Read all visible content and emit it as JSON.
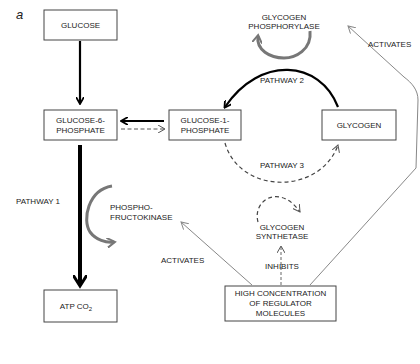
{
  "figure": {
    "panel_label": "a",
    "colors": {
      "strong_arrow": "#000000",
      "enzyme_arrow": "#777777",
      "regulation_line": "#888888",
      "dashed": "#444444"
    }
  },
  "nodes": {
    "glucose": "GLUCOSE",
    "g6p": [
      "GLUCOSE-6-",
      "PHOSPHATE"
    ],
    "g1p": [
      "GLUCOSE-1-",
      "PHOSPHATE"
    ],
    "glycogen": "GLYCOGEN",
    "atp": "ATP CO",
    "atp_sub": "2",
    "regulator": [
      "HIGH CONCENTRATION",
      "OF REGULATOR",
      "MOLECULES"
    ]
  },
  "enzymes": {
    "phosphorylase": [
      "GLYCOGEN",
      "PHOSPHORYLASE"
    ],
    "pfk": [
      "PHOSPHO-",
      "FRUCTOKINASE"
    ],
    "synthetase": [
      "GLYCOGEN",
      "SYNTHETASE"
    ]
  },
  "pathways": {
    "p1": "PATHWAY 1",
    "p2": "PATHWAY 2",
    "p3": "PATHWAY 3"
  },
  "regulation": {
    "activates_pfk": "ACTIVATES",
    "activates_phosphorylase": "ACTIVATES",
    "inhibits_synthetase": "INHIBITS"
  }
}
